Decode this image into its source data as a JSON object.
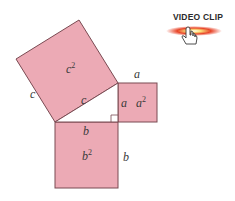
{
  "diagram": {
    "fill_color": "#ecaab5",
    "stroke_color": "#7a4a52",
    "squares": {
      "c_square": {
        "label": "c",
        "area_label_base": "c",
        "area_label_exp": "2"
      },
      "a_square": {
        "label": "a",
        "area_label_base": "a",
        "area_label_exp": "2"
      },
      "b_square": {
        "label": "b",
        "area_label_base": "b",
        "area_label_exp": "2"
      }
    },
    "side_labels": {
      "c_outer": "c",
      "c_inner": "c",
      "a_top": "a",
      "a_left": "a",
      "b_top": "b",
      "b_right": "b"
    }
  },
  "video_clip": {
    "label": "VIDEO CLIP",
    "icon": "hand-pointer-icon",
    "glow_color": "#e8452a"
  }
}
